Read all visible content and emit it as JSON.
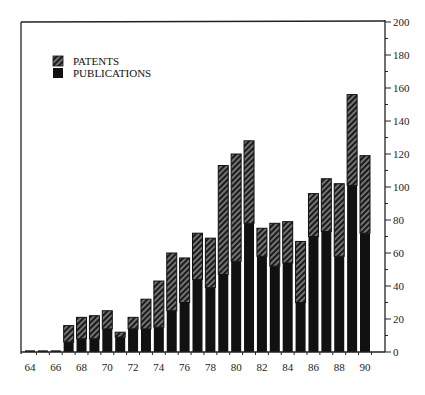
{
  "chart_data": {
    "type": "bar",
    "stacked": true,
    "title": "",
    "xlabel": "",
    "ylabel": "",
    "ylim": [
      0,
      200
    ],
    "yticks": [
      0,
      20,
      40,
      60,
      80,
      100,
      120,
      140,
      160,
      180,
      200
    ],
    "y_axis_side": "right",
    "grid": false,
    "legend_position": "top-left",
    "categories": [
      "64",
      "65",
      "66",
      "67",
      "68",
      "69",
      "70",
      "71",
      "72",
      "73",
      "74",
      "75",
      "76",
      "77",
      "78",
      "79",
      "80",
      "81",
      "82",
      "83",
      "84",
      "85",
      "86",
      "87",
      "88",
      "89",
      "90"
    ],
    "xtick_labels": [
      "64",
      "66",
      "68",
      "70",
      "72",
      "74",
      "76",
      "78",
      "80",
      "82",
      "84",
      "86",
      "88",
      "90"
    ],
    "series": [
      {
        "name": "PUBLICATIONS",
        "pattern": "solid",
        "values": [
          1,
          1,
          1,
          6,
          8,
          8,
          14,
          9,
          14,
          14,
          15,
          25,
          30,
          44,
          39,
          47,
          55,
          78,
          58,
          52,
          54,
          30,
          70,
          73,
          58,
          101,
          72
        ]
      },
      {
        "name": "PATENTS",
        "pattern": "hatched",
        "values": [
          0,
          0,
          0,
          10,
          13,
          14,
          11,
          3,
          7,
          18,
          28,
          35,
          27,
          28,
          30,
          66,
          65,
          50,
          17,
          26,
          25,
          37,
          26,
          32,
          44,
          55,
          47
        ]
      }
    ],
    "totals": [
      1,
      1,
      1,
      16,
      21,
      22,
      25,
      12,
      21,
      32,
      43,
      60,
      57,
      72,
      69,
      113,
      120,
      128,
      75,
      78,
      79,
      67,
      96,
      105,
      102,
      156,
      119
    ]
  },
  "legend": {
    "items": [
      {
        "label": "PATENTS",
        "pattern": "hatched"
      },
      {
        "label": "PUBLICATIONS",
        "pattern": "solid"
      }
    ]
  },
  "colors": {
    "bar_fill": "#111111",
    "hatch_line": "#8a8a8a",
    "axis": "#222222",
    "background": "#ffffff"
  }
}
